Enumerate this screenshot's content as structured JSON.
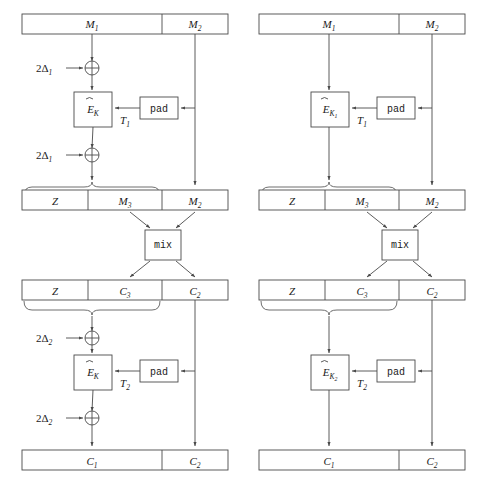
{
  "figure": {
    "type": "cryptographic-block-diagram",
    "panel_count": 2
  },
  "labels": {
    "M1": "M",
    "M1_sub": "1",
    "M2": "M",
    "M2_sub": "2",
    "M3": "M",
    "M3_sub": "3",
    "C1": "C",
    "C1_sub": "1",
    "C2": "C",
    "C2_sub": "2",
    "C3": "C",
    "C3_sub": "3",
    "Z": "Z",
    "pad": "pad",
    "mix": "mix",
    "T1": "T",
    "T1_sub": "1",
    "T2": "T",
    "T2_sub": "2",
    "E": "E",
    "K": "K",
    "K1_sub": "1",
    "K2_sub": "2",
    "delta_prefix": "2",
    "delta": "Δ",
    "delta1_sub": "1",
    "delta2_sub": "2"
  },
  "left_panel": {
    "name": "left-diagram",
    "top_bar": {
      "segments": [
        "M1",
        "M2"
      ]
    },
    "xor_top": {
      "input_label": "2Δ1"
    },
    "cipher_top": {
      "label": "E_K",
      "tweak": "T1"
    },
    "pad_top": {
      "label": "pad"
    },
    "xor_bottom_top": {
      "input_label": "2Δ1"
    },
    "mid_bar": {
      "segments": [
        "Z",
        "M3",
        "M2"
      ]
    },
    "mix": {
      "label": "mix"
    },
    "mid_bar2": {
      "segments": [
        "Z",
        "C3",
        "C2"
      ]
    },
    "xor_top2": {
      "input_label": "2Δ2"
    },
    "cipher_bottom": {
      "label": "E_K",
      "tweak": "T2"
    },
    "pad_bottom": {
      "label": "pad"
    },
    "xor_bottom2": {
      "input_label": "2Δ2"
    },
    "bottom_bar": {
      "segments": [
        "C1",
        "C2"
      ]
    }
  },
  "right_panel": {
    "name": "right-diagram",
    "top_bar": {
      "segments": [
        "M1",
        "M2"
      ]
    },
    "cipher_top": {
      "label": "E_K1",
      "tweak": "T1"
    },
    "pad_top": {
      "label": "pad"
    },
    "mid_bar": {
      "segments": [
        "Z",
        "M3",
        "M2"
      ]
    },
    "mix": {
      "label": "mix"
    },
    "mid_bar2": {
      "segments": [
        "Z",
        "C3",
        "C2"
      ]
    },
    "cipher_bottom": {
      "label": "E_K2",
      "tweak": "T2"
    },
    "pad_bottom": {
      "label": "pad"
    },
    "bottom_bar": {
      "segments": [
        "C1",
        "C2"
      ]
    }
  },
  "colors": {
    "stroke": "#4a4a4a",
    "text": "#1a1a1a",
    "background": "#ffffff"
  }
}
